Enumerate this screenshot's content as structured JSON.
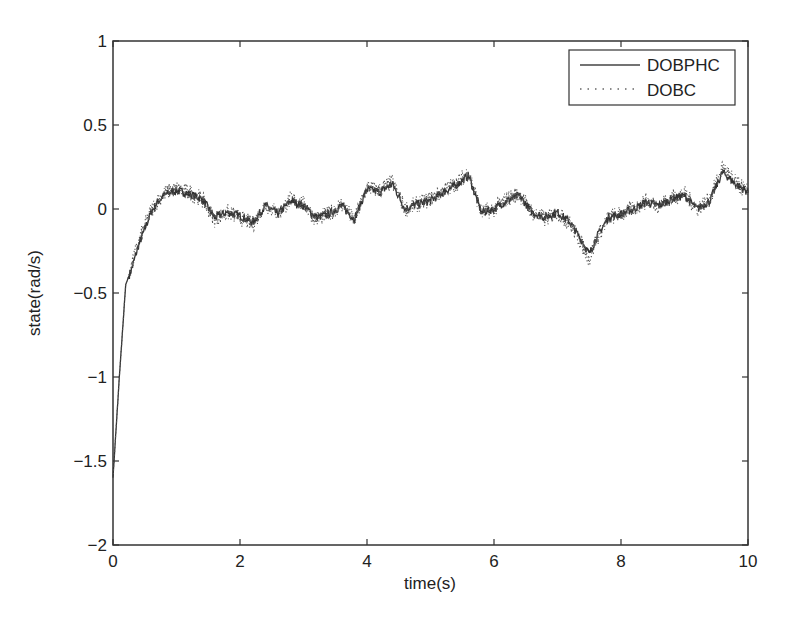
{
  "chart_data": {
    "type": "line",
    "title": "",
    "xlabel": "time(s)",
    "ylabel": "state(rad/s)",
    "xlim": [
      0,
      10
    ],
    "ylim": [
      -2,
      1
    ],
    "xticks": [
      0,
      2,
      4,
      6,
      8,
      10
    ],
    "xtick_labels": [
      "0",
      "2",
      "4",
      "6",
      "8",
      "10"
    ],
    "yticks": [
      1,
      0.5,
      0,
      -0.5,
      -1,
      -1.5,
      -2
    ],
    "ytick_labels": [
      "1",
      "0.5",
      "0",
      "-0.5",
      "-1",
      "-1.5",
      "-2"
    ],
    "grid": false,
    "legend_position": "upper right",
    "legend": [
      {
        "label": "DOBPHC",
        "style": "solid"
      },
      {
        "label": "DOBC",
        "style": "dotted"
      }
    ],
    "x": [
      0,
      0.1,
      0.2,
      0.3,
      0.4,
      0.5,
      0.6,
      0.7,
      0.8,
      0.9,
      1.0,
      1.2,
      1.4,
      1.6,
      1.8,
      2.0,
      2.2,
      2.4,
      2.6,
      2.8,
      3.0,
      3.2,
      3.4,
      3.6,
      3.8,
      4.0,
      4.2,
      4.4,
      4.6,
      4.8,
      5.0,
      5.2,
      5.4,
      5.6,
      5.8,
      6.0,
      6.2,
      6.4,
      6.6,
      6.8,
      7.0,
      7.2,
      7.4,
      7.5,
      7.6,
      7.8,
      8.0,
      8.2,
      8.4,
      8.6,
      8.8,
      9.0,
      9.2,
      9.4,
      9.6,
      9.8,
      10.0
    ],
    "series": [
      {
        "name": "DOBPHC",
        "values": [
          -1.6,
          -1.0,
          -0.45,
          -0.35,
          -0.22,
          -0.12,
          -0.02,
          0.04,
          0.08,
          0.1,
          0.11,
          0.09,
          0.06,
          -0.05,
          -0.02,
          -0.04,
          -0.08,
          0.02,
          -0.03,
          0.05,
          0.02,
          -0.05,
          -0.03,
          0.02,
          -0.06,
          0.12,
          0.1,
          0.15,
          0.0,
          0.03,
          0.05,
          0.1,
          0.14,
          0.2,
          -0.02,
          0.0,
          0.05,
          0.08,
          -0.02,
          -0.05,
          -0.02,
          -0.08,
          -0.2,
          -0.27,
          -0.18,
          -0.05,
          -0.03,
          0.0,
          0.04,
          0.02,
          0.06,
          0.08,
          0.0,
          0.05,
          0.22,
          0.15,
          0.1
        ]
      },
      {
        "name": "DOBC",
        "values": [
          -1.6,
          -1.0,
          -0.45,
          -0.33,
          -0.2,
          -0.1,
          -0.01,
          0.05,
          0.09,
          0.11,
          0.12,
          0.1,
          0.06,
          -0.06,
          -0.02,
          -0.05,
          -0.09,
          0.03,
          -0.03,
          0.06,
          0.03,
          -0.06,
          -0.03,
          0.03,
          -0.07,
          0.13,
          0.11,
          0.16,
          0.0,
          0.03,
          0.06,
          0.11,
          0.15,
          0.22,
          -0.02,
          0.0,
          0.06,
          0.09,
          -0.02,
          -0.06,
          -0.02,
          -0.09,
          -0.22,
          -0.3,
          -0.19,
          -0.05,
          -0.03,
          0.0,
          0.05,
          0.02,
          0.07,
          0.09,
          0.0,
          0.06,
          0.25,
          0.16,
          0.1
        ]
      }
    ]
  }
}
